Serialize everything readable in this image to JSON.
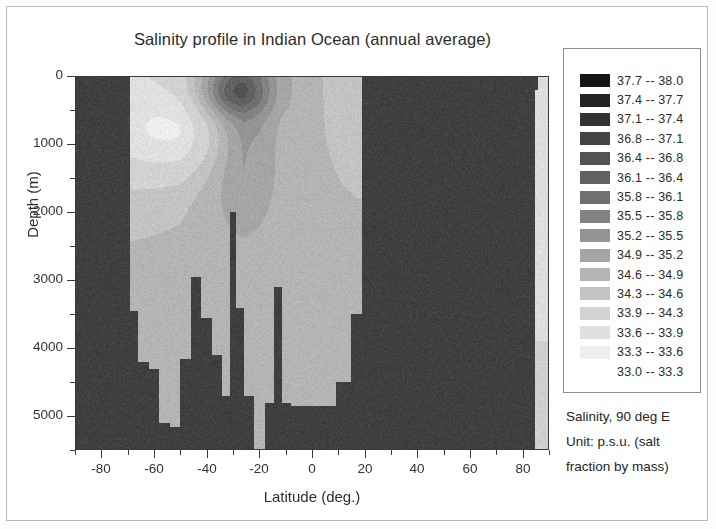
{
  "figure": {
    "title": "Salinity profile in Indian Ocean (annual average)"
  },
  "legend": {
    "caption_lines": [
      "Salinity, 90 deg E",
      "Unit: p.s.u. (salt",
      "fraction by mass)"
    ],
    "entries": [
      {
        "label": "37.7  --  38.0",
        "low": 37.7,
        "high": 38.0,
        "color": "#161616"
      },
      {
        "label": "37.4  --  37.7",
        "low": 37.4,
        "high": 37.7,
        "color": "#242424"
      },
      {
        "label": "37.1  --  37.4",
        "low": 37.1,
        "high": 37.4,
        "color": "#333333"
      },
      {
        "label": "36.8  --  37.1",
        "low": 36.8,
        "high": 37.1,
        "color": "#434343"
      },
      {
        "label": "36.4  --  36.8",
        "low": 36.4,
        "high": 36.8,
        "color": "#525252"
      },
      {
        "label": "36.1  --  36.4",
        "low": 36.1,
        "high": 36.4,
        "color": "#616161"
      },
      {
        "label": "35.8  --  36.1",
        "low": 35.8,
        "high": 36.1,
        "color": "#707070"
      },
      {
        "label": "35.5  --  35.8",
        "low": 35.5,
        "high": 35.8,
        "color": "#828282"
      },
      {
        "label": "35.2  --  35.5",
        "low": 35.2,
        "high": 35.5,
        "color": "#949494"
      },
      {
        "label": "34.9  --  35.2",
        "low": 34.9,
        "high": 35.2,
        "color": "#a5a5a5"
      },
      {
        "label": "34.6  --  34.9",
        "low": 34.6,
        "high": 34.9,
        "color": "#b4b4b4"
      },
      {
        "label": "34.3  --  34.6",
        "low": 34.3,
        "high": 34.6,
        "color": "#c3c3c3"
      },
      {
        "label": "33.9  --  34.3",
        "low": 33.9,
        "high": 34.3,
        "color": "#d2d2d2"
      },
      {
        "label": "33.6  --  33.9",
        "low": 33.6,
        "high": 33.9,
        "color": "#e0e0e0"
      },
      {
        "label": "33.3  --  33.6",
        "low": 33.3,
        "high": 33.6,
        "color": "#eeeeee"
      },
      {
        "label": "33.0  --  33.3",
        "low": 33.0,
        "high": 33.3,
        "color": "#ffffff"
      }
    ]
  },
  "chart_data": {
    "type": "heatmap",
    "title": "Salinity profile in Indian Ocean (annual average)",
    "xlabel": "Latitude (deg.)",
    "ylabel": "Depth (m)",
    "xlim": [
      -90,
      90
    ],
    "ylim": [
      5500,
      0
    ],
    "y_inverted": true,
    "grid": false,
    "legend_position": "right",
    "colorbar_label": "Salinity, 90 deg E",
    "colorbar_unit": "p.s.u. (salt fraction by mass)",
    "x_ticks": [
      -80,
      -60,
      -40,
      -20,
      0,
      20,
      40,
      60,
      80
    ],
    "x_tick_labels": [
      "-80",
      "-60",
      "-40",
      "-20",
      "0",
      "20",
      "40",
      "60",
      "80"
    ],
    "x_minor_ticks": [
      -90,
      -70,
      -50,
      -30,
      -10,
      10,
      30,
      50,
      70,
      90
    ],
    "y_ticks": [
      0,
      1000,
      2000,
      3000,
      4000,
      5000
    ],
    "y_tick_labels": [
      "0",
      "1000",
      "2000",
      "3000",
      "4000",
      "5000"
    ],
    "y_minor_ticks": [
      500,
      1500,
      2500,
      3500,
      4500,
      5500
    ],
    "mask_color": "#3f3f3f",
    "mask_note": "Dark uniform fill marks land / below-seafloor / no-data cells",
    "value_range": [
      33.0,
      38.0
    ],
    "x_cell_centers": [
      -88,
      -84,
      -80,
      -76,
      -72,
      -68,
      -64,
      -60,
      -56,
      -52,
      -48,
      -44,
      -40,
      -36,
      -32,
      -28,
      -24,
      -20,
      -16,
      -12,
      -8,
      -4,
      0,
      4,
      8,
      12,
      16,
      20,
      24,
      28,
      32,
      36,
      40,
      44,
      48,
      52,
      56,
      60,
      64,
      68,
      72,
      76,
      80,
      84,
      88
    ],
    "y_cell_centers": [
      50,
      150,
      300,
      500,
      700,
      900,
      1100,
      1300,
      1500,
      1700,
      1900,
      2100,
      2300,
      2500,
      2700,
      2900,
      3100,
      3300,
      3500,
      3700,
      3900,
      4100,
      4300,
      4500,
      4700,
      4900,
      5100,
      5300,
      5450
    ],
    "seafloor_depth_by_latitude": [
      {
        "lat": -88,
        "depth": 0
      },
      {
        "lat": -70,
        "depth": 0
      },
      {
        "lat": -68,
        "depth": 3450
      },
      {
        "lat": -64,
        "depth": 4200
      },
      {
        "lat": -60,
        "depth": 4300
      },
      {
        "lat": -56,
        "depth": 5100
      },
      {
        "lat": -52,
        "depth": 5150
      },
      {
        "lat": -48,
        "depth": 4150
      },
      {
        "lat": -44,
        "depth": 2950
      },
      {
        "lat": -40,
        "depth": 3550
      },
      {
        "lat": -36,
        "depth": 4100
      },
      {
        "lat": -32,
        "depth": 4700
      },
      {
        "lat": -30,
        "depth": 2000
      },
      {
        "lat": -28,
        "depth": 3400
      },
      {
        "lat": -24,
        "depth": 4700
      },
      {
        "lat": -20,
        "depth": 5500
      },
      {
        "lat": -16,
        "depth": 4800
      },
      {
        "lat": -13,
        "depth": 3100
      },
      {
        "lat": -10,
        "depth": 4800
      },
      {
        "lat": -6,
        "depth": 4850
      },
      {
        "lat": 0,
        "depth": 4850
      },
      {
        "lat": 6,
        "depth": 4850
      },
      {
        "lat": 12,
        "depth": 4500
      },
      {
        "lat": 18,
        "depth": 3500
      },
      {
        "lat": 20,
        "depth": 0
      },
      {
        "lat": 90,
        "depth": 0
      }
    ],
    "surface_salinity_by_latitude": [
      {
        "lat": -68,
        "value": 33.9
      },
      {
        "lat": -60,
        "value": 34.0
      },
      {
        "lat": -50,
        "value": 34.2
      },
      {
        "lat": -40,
        "value": 34.9
      },
      {
        "lat": -32,
        "value": 35.6
      },
      {
        "lat": -26,
        "value": 35.9
      },
      {
        "lat": -20,
        "value": 35.6
      },
      {
        "lat": -12,
        "value": 35.0
      },
      {
        "lat": -4,
        "value": 34.8
      },
      {
        "lat": 4,
        "value": 34.6
      },
      {
        "lat": 12,
        "value": 34.4
      },
      {
        "lat": 18,
        "value": 34.3
      }
    ],
    "features": [
      "Subsurface salinity maximum (36.1-36.4) centred near 25-35 S at 100-400 m depth",
      "Low-salinity Antarctic surface / intermediate water (33.9-34.6) south of 50 S",
      "Deep water broadly 34.6-34.9 below 2000 m",
      "Mid-ocean ridge and seamount spikes near 44 S, 30 S, 20 S and 13 S",
      "Northern boundary of the section at about 20 N (Asian landmass)"
    ]
  },
  "axes": {
    "x_title": "Latitude (deg.)",
    "y_title": "Depth (m)"
  }
}
